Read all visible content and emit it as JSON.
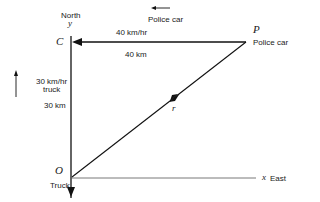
{
  "diagram": {
    "points": {
      "C": {
        "label": "C"
      },
      "P": {
        "label": "P",
        "caption": "Police car"
      },
      "O": {
        "label": "O",
        "caption": "Truck"
      }
    },
    "axes": {
      "y": {
        "name": "y",
        "direction": "North"
      },
      "x": {
        "name": "x",
        "direction": "East"
      }
    },
    "police_car": {
      "legend_label": "Police car",
      "speed": "40 km/hr",
      "distance": "40 km"
    },
    "truck": {
      "speed_line1": "30 km/hr",
      "speed_line2": "truck",
      "distance": "30 km"
    },
    "vector": {
      "label": "r⃗"
    }
  }
}
